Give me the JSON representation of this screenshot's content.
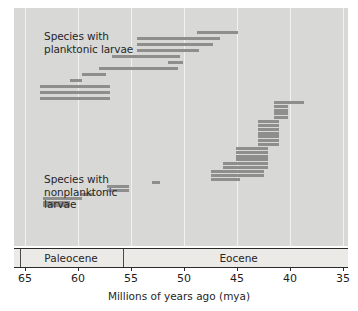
{
  "chart_data": {
    "type": "bar",
    "title": "",
    "xlabel": "Millions of years ago (mya)",
    "ylabel": "",
    "xlim": [
      65,
      35
    ],
    "x_ticks": [
      65,
      60,
      55,
      50,
      45,
      40,
      35
    ],
    "x_tick_labels": [
      "65",
      "60",
      "55",
      "50",
      "45",
      "40",
      "35"
    ],
    "axis_direction": "reversed",
    "grid": true,
    "legend_position": "none",
    "annotations": [
      {
        "name": "planktonic-label",
        "text": "Species with\nplanktonic larvae",
        "line1": "Species with",
        "line2": "planktonic larvae",
        "x_mya": 63.2,
        "y_px": 22
      },
      {
        "name": "nonplanktonic-label",
        "text": "Species with\nnonplanktonic\nlarvae",
        "line1": "Species with",
        "line2": "nonplanktonic",
        "line3": "larvae",
        "x_mya": 63.2,
        "y_px": 165
      }
    ],
    "epochs": [
      {
        "name": "Paleocene",
        "start_mya": 65.5,
        "end_mya": 55.8
      },
      {
        "name": "Eocene",
        "start_mya": 55.8,
        "end_mya": 33.9
      }
    ],
    "series": [
      {
        "name": "Species with planktonic larvae",
        "bar_color": "#8e8e8c",
        "ranges": [
          {
            "id": "p1",
            "start_mya": 48.8,
            "end_mya": 44.9,
            "row": 0
          },
          {
            "id": "p2",
            "start_mya": 54.4,
            "end_mya": 46.6,
            "row": 1
          },
          {
            "id": "p3",
            "start_mya": 54.4,
            "end_mya": 47.3,
            "row": 2
          },
          {
            "id": "p4",
            "start_mya": 54.4,
            "end_mya": 48.6,
            "row": 3
          },
          {
            "id": "p5",
            "start_mya": 56.8,
            "end_mya": 50.4,
            "row": 4
          },
          {
            "id": "p6",
            "start_mya": 51.5,
            "end_mya": 50.1,
            "row": 5
          },
          {
            "id": "p7",
            "start_mya": 58.0,
            "end_mya": 50.6,
            "row": 6
          },
          {
            "id": "p8",
            "start_mya": 59.6,
            "end_mya": 57.4,
            "row": 7
          },
          {
            "id": "p9",
            "start_mya": 60.8,
            "end_mya": 59.6,
            "row": 8
          },
          {
            "id": "p10",
            "start_mya": 63.6,
            "end_mya": 57.0,
            "row": 9
          },
          {
            "id": "p11",
            "start_mya": 63.6,
            "end_mya": 57.0,
            "row": 10
          },
          {
            "id": "p12",
            "start_mya": 63.6,
            "end_mya": 57.0,
            "row": 11
          }
        ]
      },
      {
        "name": "Species with nonplanktonic larvae",
        "bar_color": "#8e8e8c",
        "ranges": [
          {
            "id": "n1",
            "start_mya": 41.5,
            "end_mya": 38.7,
            "row": 0
          },
          {
            "id": "n2",
            "start_mya": 41.5,
            "end_mya": 40.2,
            "row": 1
          },
          {
            "id": "n3",
            "start_mya": 41.5,
            "end_mya": 40.2,
            "row": 2
          },
          {
            "id": "n4",
            "start_mya": 41.5,
            "end_mya": 40.2,
            "row": 3
          },
          {
            "id": "n5",
            "start_mya": 41.5,
            "end_mya": 40.2,
            "row": 4
          },
          {
            "id": "n6",
            "start_mya": 43.0,
            "end_mya": 41.0,
            "row": 5
          },
          {
            "id": "n7",
            "start_mya": 43.0,
            "end_mya": 41.0,
            "row": 6
          },
          {
            "id": "n8",
            "start_mya": 43.0,
            "end_mya": 41.0,
            "row": 7
          },
          {
            "id": "n9",
            "start_mya": 43.0,
            "end_mya": 41.0,
            "row": 8
          },
          {
            "id": "n10",
            "start_mya": 43.0,
            "end_mya": 41.0,
            "row": 9
          },
          {
            "id": "n11",
            "start_mya": 43.0,
            "end_mya": 41.0,
            "row": 10
          },
          {
            "id": "n12",
            "start_mya": 43.0,
            "end_mya": 41.0,
            "row": 11
          },
          {
            "id": "n13",
            "start_mya": 45.1,
            "end_mya": 42.1,
            "row": 12
          },
          {
            "id": "n14",
            "start_mya": 45.1,
            "end_mya": 42.1,
            "row": 13
          },
          {
            "id": "n15",
            "start_mya": 45.1,
            "end_mya": 42.1,
            "row": 14
          },
          {
            "id": "n16",
            "start_mya": 45.1,
            "end_mya": 42.1,
            "row": 15
          },
          {
            "id": "n17",
            "start_mya": 46.3,
            "end_mya": 42.1,
            "row": 16
          },
          {
            "id": "n18",
            "start_mya": 46.3,
            "end_mya": 42.1,
            "row": 17
          },
          {
            "id": "n19",
            "start_mya": 47.5,
            "end_mya": 42.5,
            "row": 18
          },
          {
            "id": "n20",
            "start_mya": 47.5,
            "end_mya": 42.5,
            "row": 19
          },
          {
            "id": "n21",
            "start_mya": 47.5,
            "end_mya": 44.7,
            "row": 20
          },
          {
            "id": "n22",
            "start_mya": 53.0,
            "end_mya": 52.3,
            "row": 21
          },
          {
            "id": "n23",
            "start_mya": 57.3,
            "end_mya": 55.2,
            "row": 22
          },
          {
            "id": "n24",
            "start_mya": 57.3,
            "end_mya": 55.2,
            "row": 23
          },
          {
            "id": "n25",
            "start_mya": 59.7,
            "end_mya": 58.5,
            "row": 24
          },
          {
            "id": "n26",
            "start_mya": 63.3,
            "end_mya": 59.6,
            "row": 25
          },
          {
            "id": "n27",
            "start_mya": 63.3,
            "end_mya": 60.8,
            "row": 26
          },
          {
            "id": "n28",
            "start_mya": 63.3,
            "end_mya": 60.8,
            "row": 27
          }
        ]
      }
    ]
  },
  "colors": {
    "plot_background": "#d8d8d6",
    "bar": "#8e8e8c",
    "gridline": "#f2f1ef",
    "axis": "#2a2a2a",
    "epoch_band": "#eceae7",
    "text": "#262626"
  }
}
